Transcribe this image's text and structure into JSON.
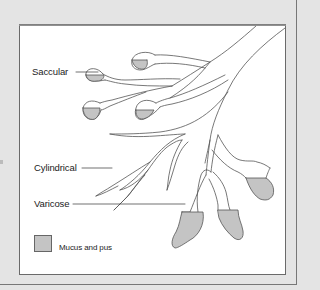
{
  "figure": {
    "labels": {
      "saccular": "Saccular",
      "cylindrical": "Cylindrical",
      "varicose": "Varicose"
    },
    "legend": {
      "swatch_color": "#c4c4c4",
      "label": "Mucus and pus"
    }
  },
  "colors": {
    "background": "#e4e4e4",
    "panel": "#ffffff",
    "outline": "#555555",
    "fill_mucus": "#c4c4c4",
    "frame": "#6a6a6a"
  }
}
